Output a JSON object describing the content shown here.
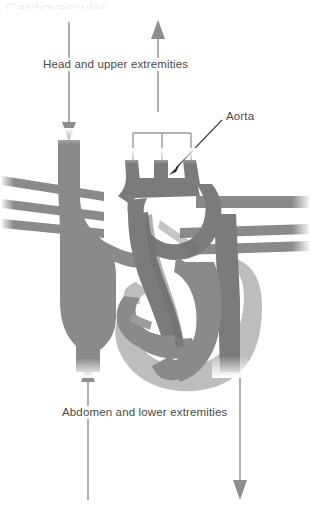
{
  "figure": {
    "title_cropped": "Cardiovascular",
    "labels": {
      "head": "Head and upper extremities",
      "abdomen": "Abdomen and lower extremities",
      "aorta": "Aorta"
    },
    "colors": {
      "background": "#ffffff",
      "vessel_dark": "#7b7b7b",
      "vessel_mid": "#8a8a8a",
      "myocardium_light": "#bdbdbd",
      "outline": "#9a9a9a",
      "text": "#4a4a4a",
      "arrow": "#8e8e8e",
      "leader_line": "#3a3a3a"
    },
    "arrows": [
      {
        "name": "head-return-arrow",
        "direction": "down",
        "x": 69,
        "from_y": 22,
        "to_y": 139,
        "meaning": "blood from head and upper extremities into superior vena cava"
      },
      {
        "name": "head-supply-arrow",
        "direction": "up",
        "x": 158,
        "from_y": 112,
        "to_y": 20,
        "meaning": "blood out to head and upper extremities"
      },
      {
        "name": "abdomen-return-arrow",
        "direction": "up",
        "x": 88,
        "from_y": 500,
        "to_y": 363,
        "meaning": "blood from abdomen and lower extremities into inferior vena cava"
      },
      {
        "name": "abdomen-supply-arrow",
        "direction": "down",
        "x": 240,
        "from_y": 372,
        "to_y": 500,
        "meaning": "blood out to abdomen and lower extremities via descending aorta"
      }
    ],
    "branch_bracket": {
      "name": "arch-branch-bracket",
      "horizontal_y": 133,
      "left_x": 133,
      "right_x": 191,
      "stems_x": [
        133,
        162,
        191
      ],
      "stem_bottom_y": 160
    },
    "leader": {
      "name": "aorta-leader-line",
      "from": [
        222,
        120
      ],
      "to": [
        170,
        172
      ]
    },
    "structures": [
      {
        "name": "superior-vena-cava",
        "tone": "vessel_mid"
      },
      {
        "name": "right-atrium",
        "tone": "vessel_mid"
      },
      {
        "name": "inferior-vena-cava",
        "tone": "vessel_mid"
      },
      {
        "name": "aortic-arch",
        "tone": "vessel_dark"
      },
      {
        "name": "brachiocephalic-trunk",
        "tone": "vessel_dark"
      },
      {
        "name": "left-common-carotid-artery",
        "tone": "vessel_dark"
      },
      {
        "name": "left-subclavian-artery",
        "tone": "vessel_dark"
      },
      {
        "name": "descending-aorta",
        "tone": "vessel_dark"
      },
      {
        "name": "pulmonary-arteries-left",
        "tone": "vessel_mid"
      },
      {
        "name": "pulmonary-veins-right",
        "tone": "vessel_mid"
      },
      {
        "name": "left-ventricle-myocardium",
        "tone": "myocardium_light"
      },
      {
        "name": "right-ventricle",
        "tone": "vessel_mid"
      },
      {
        "name": "interventricular-septum",
        "tone": "vessel_dark"
      }
    ]
  }
}
